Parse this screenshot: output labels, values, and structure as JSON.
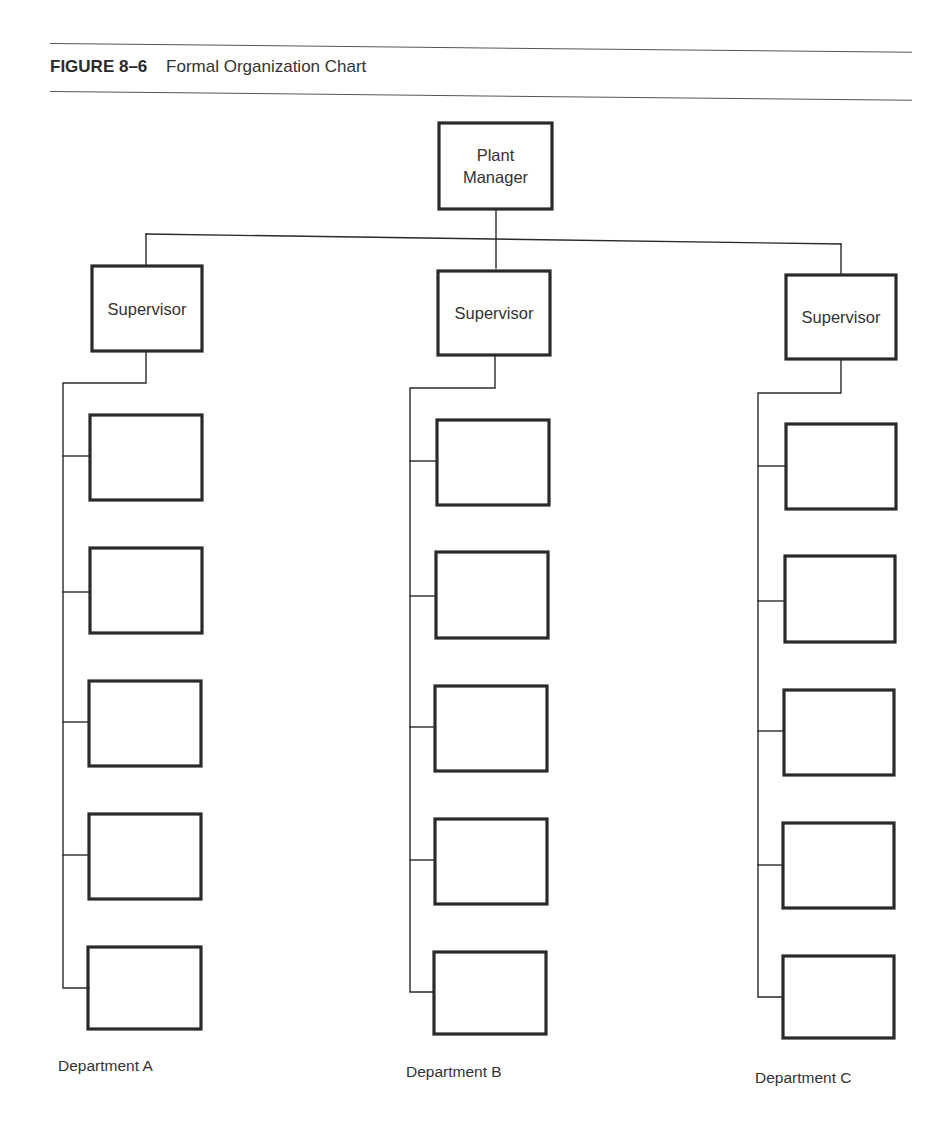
{
  "figure": {
    "number": "FIGURE 8–6",
    "title": "Formal Organization Chart"
  },
  "org_chart": {
    "root": {
      "label_line1": "Plant",
      "label_line2": "Manager"
    },
    "departments": [
      {
        "name": "Department A",
        "supervisor": "Supervisor",
        "subordinate_boxes": [
          "",
          "",
          "",
          "",
          ""
        ]
      },
      {
        "name": "Department B",
        "supervisor": "Supervisor",
        "subordinate_boxes": [
          "",
          "",
          "",
          "",
          ""
        ]
      },
      {
        "name": "Department C",
        "supervisor": "Supervisor",
        "subordinate_boxes": [
          "",
          "",
          "",
          "",
          ""
        ]
      }
    ]
  },
  "colors": {
    "line": "#2a2a2a",
    "text": "#333333",
    "background": "#ffffff"
  }
}
